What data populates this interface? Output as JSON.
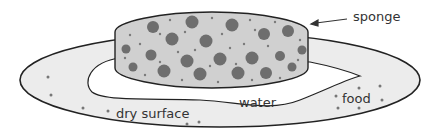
{
  "diagram": {
    "labels": {
      "sponge": "sponge",
      "water": "water",
      "food": "food",
      "dry_surface": "dry surface"
    },
    "colors": {
      "outline": "#222222",
      "plate_fill": "#ececec",
      "sponge_fill": "#cfcfcf",
      "pore": "#707070",
      "water_fill": "#ffffff"
    }
  }
}
